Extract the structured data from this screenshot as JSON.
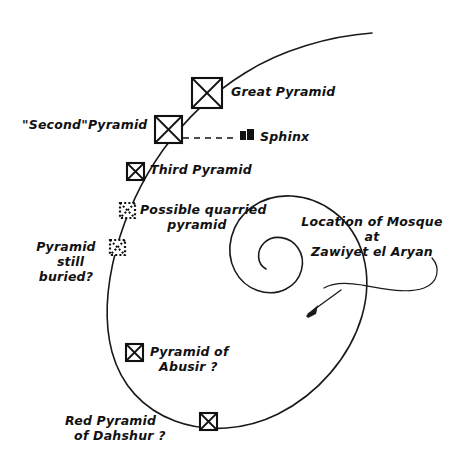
{
  "figure": {
    "background_color": "#ffffff",
    "ink_color": "#111111"
  },
  "labels": {
    "great_pyramid": "Great Pyramid",
    "second_pyramid": "\"Second\"Pyramid",
    "sphinx": "Sphinx",
    "third_pyramid": "Third Pyramid",
    "possible_quarried": "Possible quarried\n      pyramid",
    "pyramid_buried": "Pyramid\n  still\nburied?",
    "mosque_note": "Location of Mosque\nat\nZawiyet el Aryan",
    "abusir": "Pyramid of\n  Abusir ?",
    "dahshur": "Red Pyramid\n  of Dahshur ?"
  },
  "markers": [
    {
      "name": "great-pyramid",
      "style": "solid",
      "x": 192,
      "y": 78,
      "size": 30
    },
    {
      "name": "second-pyramid",
      "style": "solid",
      "x": 155,
      "y": 116,
      "size": 26
    },
    {
      "name": "third-pyramid",
      "style": "solid",
      "x": 127,
      "y": 163,
      "size": 18
    },
    {
      "name": "possible-quarried-pyramid",
      "style": "dotted",
      "x": 120,
      "y": 203,
      "size": 16
    },
    {
      "name": "pyramid-still-buried",
      "style": "dotted",
      "x": 110,
      "y": 240,
      "size": 16
    },
    {
      "name": "abusir-pyramid",
      "style": "solid",
      "x": 126,
      "y": 344,
      "size": 18
    },
    {
      "name": "dahshur-pyramid",
      "style": "solid",
      "x": 200,
      "y": 413,
      "size": 18
    }
  ],
  "icons": {
    "sphinx_marker": "sphinx-glyph",
    "arrow": "arrow-icon"
  }
}
